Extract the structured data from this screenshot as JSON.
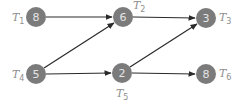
{
  "diagram": {
    "type": "task-precedence-graph",
    "colors": {
      "node_fill": "#7b7b7b",
      "node_text": "#e6e6e6",
      "label": "#8e8e8e",
      "edge": "#2a2a2a"
    },
    "nodes": [
      {
        "id": "T1",
        "label_main": "T",
        "label_sub": "1",
        "value": "8",
        "x": 36,
        "y": 17,
        "label_pos": "left"
      },
      {
        "id": "T2",
        "label_main": "T",
        "label_sub": "2",
        "value": "6",
        "x": 123,
        "y": 17,
        "label_pos": "top-right"
      },
      {
        "id": "T3",
        "label_main": "T",
        "label_sub": "3",
        "value": "3",
        "x": 206,
        "y": 18,
        "label_pos": "right"
      },
      {
        "id": "T4",
        "label_main": "T",
        "label_sub": "4",
        "value": "5",
        "x": 36,
        "y": 74,
        "label_pos": "left"
      },
      {
        "id": "T5",
        "label_main": "T",
        "label_sub": "5",
        "value": "2",
        "x": 122,
        "y": 73,
        "label_pos": "bottom"
      },
      {
        "id": "T6",
        "label_main": "T",
        "label_sub": "6",
        "value": "8",
        "x": 206,
        "y": 74,
        "label_pos": "right"
      }
    ],
    "edges": [
      {
        "from": "T1",
        "to": "T2"
      },
      {
        "from": "T2",
        "to": "T3"
      },
      {
        "from": "T4",
        "to": "T2"
      },
      {
        "from": "T4",
        "to": "T5"
      },
      {
        "from": "T5",
        "to": "T3"
      },
      {
        "from": "T5",
        "to": "T6"
      }
    ]
  }
}
